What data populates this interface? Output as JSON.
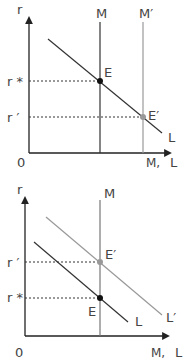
{
  "diagrams": [
    {
      "name": "money-supply-increase",
      "axis": {
        "y_label": "r",
        "x_label": "L",
        "origin_label": "0",
        "x_mid_label": "M,"
      },
      "supply_curves": [
        {
          "label": "M",
          "color": "#333333"
        },
        {
          "label": "M′",
          "color": "#999999"
        }
      ],
      "demand_curves": [
        {
          "label": "L",
          "color": "#333333"
        }
      ],
      "equilibria": [
        {
          "label": "E",
          "rate_label": "r *",
          "color": "#111111"
        },
        {
          "label": "E′",
          "rate_label": "r ′",
          "color": "#999999"
        }
      ]
    },
    {
      "name": "money-demand-increase",
      "axis": {
        "y_label": "r",
        "x_label": "L",
        "origin_label": "0",
        "x_mid_label": "M,"
      },
      "supply_curves": [
        {
          "label": "M",
          "color": "#777777"
        }
      ],
      "demand_curves": [
        {
          "label": "L",
          "color": "#333333"
        },
        {
          "label": "L′",
          "color": "#999999"
        }
      ],
      "equilibria": [
        {
          "label": "E′",
          "rate_label": "r ′",
          "color": "#999999"
        },
        {
          "label": "E",
          "rate_label": "r *",
          "color": "#111111"
        }
      ]
    }
  ]
}
